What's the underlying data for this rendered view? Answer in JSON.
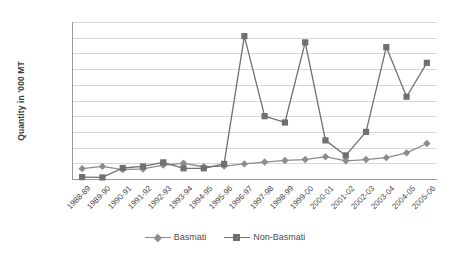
{
  "chart_data": {
    "type": "line",
    "title": "",
    "xlabel": "",
    "ylabel": "Quantity in '000 MT",
    "ylim": [
      0,
      5000
    ],
    "ytick_step": 500,
    "yticks": [
      0,
      500,
      1000,
      1500,
      2000,
      2500,
      3000,
      3500,
      4000,
      4500,
      5000
    ],
    "grid": true,
    "legend_position": "bottom",
    "categories": [
      "1988-89",
      "1989-90",
      "1990-91",
      "1991-92",
      "1992-93",
      "1993-94",
      "1994-95",
      "1995-96",
      "1996-97",
      "1997-98",
      "1998-99",
      "1999-00",
      "2000-01",
      "2001-02",
      "2002-03",
      "2003-04",
      "2004-05",
      "2005-06"
    ],
    "series": [
      {
        "name": "Basmati",
        "marker": "diamond",
        "color": "#8c8c8c",
        "values": [
          330,
          400,
          300,
          320,
          440,
          500,
          390,
          410,
          480,
          540,
          590,
          620,
          710,
          580,
          620,
          680,
          830,
          1130
        ]
      },
      {
        "name": "Non-Basmati",
        "marker": "square",
        "color": "#707070",
        "values": [
          60,
          50,
          350,
          400,
          530,
          340,
          340,
          480,
          4550,
          2000,
          1800,
          4350,
          1230,
          750,
          1500,
          4200,
          2620,
          3700
        ]
      }
    ]
  },
  "legend": {
    "items": [
      {
        "label": "Basmati"
      },
      {
        "label": "Non-Basmati"
      }
    ]
  }
}
